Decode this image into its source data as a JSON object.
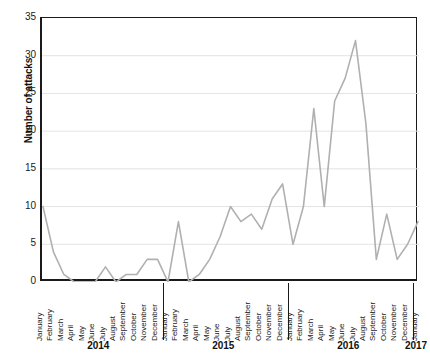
{
  "chart_data": {
    "type": "line",
    "title": "",
    "xlabel": "",
    "ylabel": "Number of attacks",
    "ylim": [
      0,
      35
    ],
    "yticks": [
      0,
      5,
      10,
      15,
      20,
      25,
      30,
      35
    ],
    "grid": "horizontal",
    "legend": "none",
    "line_color": "#b0b0b0",
    "axis_color": "#1a1a1a",
    "grid_color": "#e3e3e3",
    "categories": [
      "January",
      "February",
      "March",
      "April",
      "May",
      "June",
      "July",
      "August",
      "September",
      "October",
      "November",
      "December",
      "January",
      "February",
      "March",
      "April",
      "May",
      "June",
      "July",
      "August",
      "September",
      "October",
      "November",
      "December",
      "January",
      "February",
      "March",
      "April",
      "May",
      "June",
      "July",
      "August",
      "September",
      "October",
      "November",
      "December",
      "January"
    ],
    "values": [
      10,
      4,
      1,
      0,
      0,
      0,
      2,
      0,
      1,
      1,
      3,
      3,
      0,
      8,
      0,
      1,
      3,
      6,
      10,
      8,
      9,
      7,
      11,
      13,
      5,
      10,
      23,
      10,
      24,
      27,
      32,
      21,
      3,
      9,
      3,
      5,
      8
    ],
    "years": [
      {
        "label": "2014",
        "start_index": 0,
        "end_index": 11
      },
      {
        "label": "2015",
        "start_index": 12,
        "end_index": 23
      },
      {
        "label": "2016",
        "start_index": 24,
        "end_index": 35
      },
      {
        "label": "2017",
        "start_index": 36,
        "end_index": 36
      }
    ]
  }
}
